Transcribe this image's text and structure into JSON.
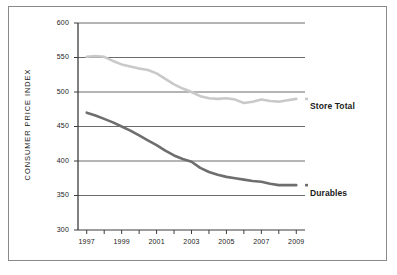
{
  "chart_data": {
    "type": "line",
    "title": "",
    "xlabel": "",
    "ylabel": "CONSUMER PRICE INDEX",
    "xlim": [
      1996.5,
      2009.5
    ],
    "ylim": [
      300,
      600
    ],
    "yticks": [
      300,
      350,
      400,
      450,
      500,
      550,
      600
    ],
    "ytick_labels": [
      "300",
      "350",
      "400",
      "450",
      "500",
      "550",
      "600"
    ],
    "xticks": [
      1997,
      1998,
      1999,
      2000,
      2001,
      2002,
      2003,
      2004,
      2005,
      2006,
      2007,
      2008,
      2009
    ],
    "xtick_labels": [
      "1997",
      "",
      "1999",
      "",
      "2001",
      "",
      "2003",
      "",
      "2005",
      "",
      "2007",
      "",
      "2009"
    ],
    "grid": "horizontal",
    "legend_position": "right-inline",
    "x": [
      1997,
      1997.5,
      1998,
      1998.5,
      1999,
      1999.5,
      2000,
      2000.5,
      2001,
      2001.5,
      2002,
      2002.5,
      2003,
      2003.5,
      2004,
      2004.5,
      2005,
      2005.5,
      2006,
      2006.5,
      2007,
      2007.5,
      2008,
      2008.5,
      2009
    ],
    "series": [
      {
        "name": "Store Total",
        "color": "#c9c9c9",
        "values": [
          551,
          552,
          551,
          545,
          540,
          537,
          534,
          532,
          527,
          519,
          511,
          505,
          500,
          494,
          491,
          490,
          491,
          489,
          484,
          486,
          489,
          487,
          486,
          488,
          490
        ]
      },
      {
        "name": "Durables",
        "color": "#6e6e6e",
        "values": [
          470,
          466,
          461,
          456,
          450,
          444,
          437,
          430,
          423,
          415,
          408,
          403,
          399,
          390,
          384,
          380,
          377,
          375,
          373,
          371,
          370,
          367,
          365,
          365,
          365
        ]
      }
    ]
  },
  "legend": {
    "store_total": "Store Total",
    "durables": "Durables"
  },
  "axis": {
    "y_title": "CONSUMER PRICE INDEX"
  }
}
